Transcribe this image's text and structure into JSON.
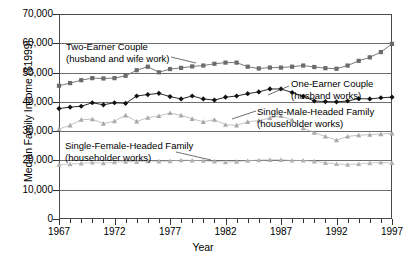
{
  "chart_data": {
    "type": "line",
    "title": "",
    "xlabel": "Year",
    "ylabel": "Median Family Income ($1999)",
    "xlim": [
      1967,
      1997
    ],
    "ylim": [
      0,
      70000
    ],
    "ytick_labels": [
      "0",
      "10,000",
      "20,000",
      "30,000",
      "40,000",
      "50,000",
      "60,000",
      "70,000"
    ],
    "ytick_values": [
      0,
      10000,
      20000,
      30000,
      40000,
      50000,
      60000,
      70000
    ],
    "xtick_labels": [
      "1967",
      "1972",
      "1977",
      "1982",
      "1987",
      "1992",
      "1997"
    ],
    "xtick_values": [
      1967,
      1972,
      1977,
      1982,
      1987,
      1992,
      1997
    ],
    "grid": true,
    "legend_position": "inline-annotations",
    "x": [
      1967,
      1968,
      1969,
      1970,
      1971,
      1972,
      1973,
      1974,
      1975,
      1976,
      1977,
      1978,
      1979,
      1980,
      1981,
      1982,
      1983,
      1984,
      1985,
      1986,
      1987,
      1988,
      1989,
      1990,
      1991,
      1992,
      1993,
      1994,
      1995,
      1996,
      1997
    ],
    "series": [
      {
        "name": "Two-Earner Couple (husband and wife work)",
        "color": "#6b6b6b",
        "marker": "square",
        "values": [
          45500,
          46400,
          47400,
          48100,
          48000,
          48100,
          48900,
          50800,
          52000,
          50100,
          51200,
          51600,
          52100,
          52400,
          53000,
          53400,
          53400,
          52000,
          51400,
          51700,
          51700,
          52000,
          52400,
          51900,
          51500,
          51300,
          52400,
          54000,
          55200,
          57000,
          59800
        ]
      },
      {
        "name": "One-Earner Couple (husband works)",
        "color": "#111111",
        "marker": "diamond",
        "values": [
          37700,
          38200,
          38500,
          39700,
          39000,
          39700,
          39500,
          42000,
          42500,
          42900,
          41800,
          41000,
          42000,
          41000,
          40600,
          41600,
          42000,
          42800,
          43400,
          44400,
          44400,
          43200,
          41900,
          40300,
          40100,
          40000,
          40300,
          41100,
          41000,
          41400,
          41600
        ]
      },
      {
        "name": "Single-Male-Headed Family (householder works)",
        "color": "#a8a8a8",
        "marker": "triangle",
        "values": [
          30700,
          32000,
          33900,
          34100,
          32600,
          33400,
          35400,
          33300,
          34600,
          35200,
          36200,
          35400,
          34200,
          33200,
          33900,
          32200,
          32000,
          33200,
          33600,
          34500,
          35200,
          33800,
          31000,
          29500,
          28200,
          26900,
          28200,
          28600,
          28800,
          29000,
          29200
        ]
      },
      {
        "name": "Single-Female-Headed Family (householder works)",
        "color": "#b2b2b2",
        "marker": "triangle",
        "values": [
          18600,
          18700,
          19000,
          19300,
          19100,
          19400,
          19600,
          19500,
          19800,
          19700,
          19800,
          20100,
          20000,
          19900,
          19700,
          19400,
          19600,
          19900,
          20100,
          20200,
          20200,
          20000,
          20000,
          19700,
          19200,
          18800,
          18600,
          18800,
          19100,
          19300,
          19200
        ]
      }
    ],
    "annotations": [
      {
        "id": "two-earner",
        "line1": "Two-Earner Couple",
        "line2": "(husband and wife work)"
      },
      {
        "id": "one-earner",
        "line1": "One-Earner Couple",
        "line2": "(husband works)"
      },
      {
        "id": "single-male",
        "line1": "Single-Male-Headed Family",
        "line2": "(householder works)"
      },
      {
        "id": "single-female",
        "line1": "Single-Female-Headed Family",
        "line2": "(householder works)"
      }
    ]
  }
}
